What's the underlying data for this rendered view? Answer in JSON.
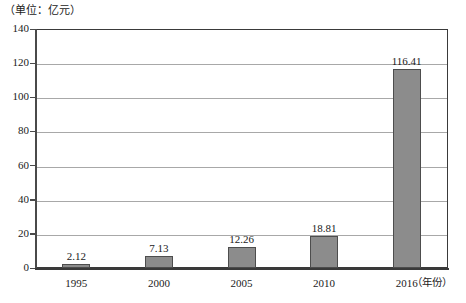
{
  "chart_data": {
    "type": "bar",
    "title": "",
    "unit_caption": "（单位：亿元）",
    "xlabel": "（年份）",
    "ylabel": "",
    "categories": [
      "1995",
      "2000",
      "2005",
      "2010",
      "2016"
    ],
    "values": [
      2.12,
      7.13,
      12.26,
      18.81,
      116.41
    ],
    "value_labels": [
      "2.12",
      "7.13",
      "12.26",
      "18.81",
      "116.41"
    ],
    "ylim": [
      0,
      140
    ],
    "ytick_step": 20,
    "ytick_labels": [
      "0",
      "20",
      "40",
      "60",
      "80",
      "100",
      "120",
      "140"
    ],
    "grid": "horizontal",
    "legend": "none",
    "bar_color": "#8c8c8c",
    "bar_border_color": "#4d4d4d",
    "gridline_color": "#a8a8a8",
    "axis_color": "#3a3a3a"
  }
}
